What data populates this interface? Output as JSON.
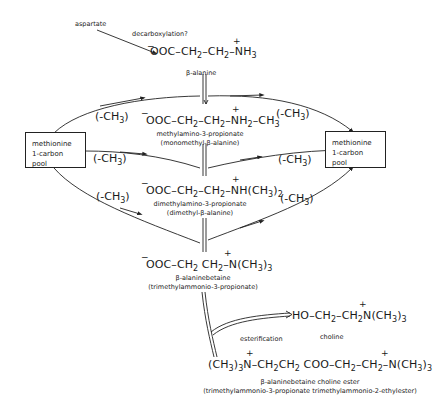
{
  "diagram": {
    "labels": {
      "aspartate": "aspartate",
      "decarboxylation": "decarboxylation?",
      "esterification": "esterification"
    },
    "pools": {
      "left": [
        "methionine",
        "1-carbon pool"
      ],
      "right": [
        "methionine",
        "1-carbon pool"
      ]
    },
    "methyl_label": "(-CH3)",
    "compounds": [
      {
        "id": "beta-alanine",
        "formula": "⁻OOC–CH₂–CH₂–N⁺H₃",
        "name": "β-alanine",
        "alt": ""
      },
      {
        "id": "methylamino-3-propionate",
        "formula": "⁻OOC–CH₂–CH₂–N⁺H₂–CH₃",
        "name": "methylamino-3-propionate",
        "alt": "(monomethyl-β-alanine)"
      },
      {
        "id": "dimethylamino-3-propionate",
        "formula": "⁻OOC–CH₂–CH₂–N⁺H(CH₃)₂",
        "name": "dimethylamino-3-propionate",
        "alt": "(dimethyl-β-alanine)"
      },
      {
        "id": "beta-alaninebetaine",
        "formula": "⁻OOC–CH₂–CH₂–N⁺(CH₃)₃",
        "name": "β-alaninebetaine",
        "alt": "(trimethylammonio-3-propionate)"
      },
      {
        "id": "choline",
        "formula": "HO–CH₂–CH₂–N⁺(CH₃)₃",
        "name": "choline",
        "alt": ""
      },
      {
        "id": "beta-alaninebetaine-choline-ester",
        "formula": "(CH₃)₃N⁺–CH₂CH₂COO–CH₂–CH₂–N⁺(CH₃)₃",
        "name": "β-alaninebetaine choline ester",
        "alt": "(trimethylammonio-3-propionate trimethylammonio-2-ethylester)"
      }
    ]
  }
}
